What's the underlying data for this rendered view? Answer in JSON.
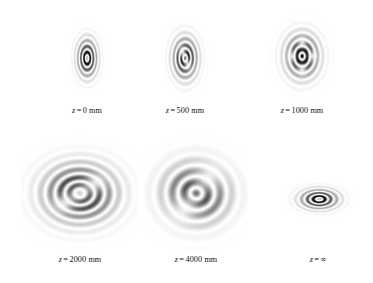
{
  "figure": {
    "type": "beam-propagation-intensity-montage",
    "background_color": "#ffffff",
    "colormap": "grayscale-inverted",
    "variable_symbol": "z",
    "equals_sign": "=",
    "rows": 2,
    "columns": 3
  },
  "chart_data": {
    "type": "heatmap",
    "title": "",
    "xlabel": "",
    "ylabel": "",
    "colormap": "gray_r",
    "panels": [
      {
        "id": "z0",
        "label_variable": "z",
        "label_equals": "=",
        "label_value": "0 mm",
        "caption": "z = 0 mm",
        "distance_mm": 0,
        "distance_display": "0",
        "unit": "mm",
        "row": 1,
        "column": 1,
        "core_lobes": 1,
        "ring_count": 3,
        "aspect": "tall-ellipse",
        "ellipse_ratio": 0.72,
        "core_radius": 0.07,
        "lobe_angle_deg": 0,
        "scale": 0.33,
        "frame_visible": false
      },
      {
        "id": "z500",
        "label_variable": "z",
        "label_equals": "=",
        "label_value": "500 mm",
        "caption": "z = 500 mm",
        "distance_mm": 500,
        "distance_display": "500",
        "unit": "mm",
        "row": 1,
        "column": 2,
        "core_lobes": 2,
        "ring_count": 3,
        "aspect": "tall-ellipse",
        "ellipse_ratio": 0.74,
        "core_radius": 0.13,
        "lobe_angle_deg": 55,
        "scale": 0.4,
        "frame_visible": false
      },
      {
        "id": "z1000",
        "label_variable": "z",
        "label_equals": "=",
        "label_value": "1000 mm",
        "caption": "z = 1000 mm",
        "distance_mm": 1000,
        "distance_display": "1000",
        "unit": "mm",
        "row": 1,
        "column": 3,
        "core_lobes": 4,
        "ring_count": 3,
        "aspect": "near-circle",
        "ellipse_ratio": 0.86,
        "core_radius": 0.2,
        "lobe_angle_deg": 45,
        "scale": 0.5,
        "frame_visible": false
      },
      {
        "id": "z2000",
        "label_variable": "z",
        "label_equals": "=",
        "label_value": "2000 mm",
        "caption": "z = 2000 mm",
        "distance_mm": 2000,
        "distance_display": "2000",
        "unit": "mm",
        "row": 2,
        "column": 1,
        "core_lobes": 3,
        "ring_count": 3,
        "aspect": "wide-ellipse",
        "ellipse_ratio": 1.26,
        "core_radius": 0.26,
        "lobe_angle_deg": 125,
        "scale": 0.92,
        "frame_visible": true
      },
      {
        "id": "z4000",
        "label_variable": "z",
        "label_equals": "=",
        "label_value": "4000 mm",
        "caption": "z = 4000 mm",
        "distance_mm": 4000,
        "distance_display": "4000",
        "unit": "mm",
        "row": 2,
        "column": 2,
        "core_lobes": 2,
        "ring_count": 2,
        "aspect": "wide-ellipse",
        "ellipse_ratio": 1.22,
        "core_radius": 0.34,
        "lobe_angle_deg": 125,
        "scale": 1.0,
        "frame_visible": true
      },
      {
        "id": "zinf",
        "label_variable": "z",
        "label_equals": "=",
        "label_value": "∞",
        "caption": "z = ∞",
        "distance_mm": null,
        "distance_display": "∞",
        "unit": "",
        "row": 2,
        "column": 3,
        "core_lobes": 1,
        "ring_count": 3,
        "aspect": "wide-ellipse",
        "ellipse_ratio": 1.62,
        "core_radius": 0.07,
        "lobe_angle_deg": 0,
        "scale": 0.44,
        "frame_visible": false
      }
    ]
  }
}
